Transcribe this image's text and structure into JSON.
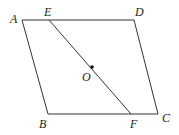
{
  "figure": {
    "type": "parallelogram-with-segment",
    "stroke_color": "#333333",
    "point_color": "#111111",
    "vertices": {
      "A": {
        "x": 22,
        "y": 20
      },
      "D": {
        "x": 134,
        "y": 20
      },
      "C": {
        "x": 158,
        "y": 114
      },
      "B": {
        "x": 48,
        "y": 114
      }
    },
    "points": {
      "E": {
        "x": 49,
        "y": 20
      },
      "F": {
        "x": 131,
        "y": 114
      },
      "O": {
        "x": 92,
        "y": 67
      }
    },
    "segments": [
      {
        "from": "A",
        "to": "D"
      },
      {
        "from": "D",
        "to": "C"
      },
      {
        "from": "C",
        "to": "B"
      },
      {
        "from": "B",
        "to": "A"
      },
      {
        "from": "E",
        "to": "F"
      }
    ],
    "labels": {
      "A": "A",
      "B": "B",
      "C": "C",
      "D": "D",
      "E": "E",
      "F": "F",
      "O": "O"
    }
  }
}
